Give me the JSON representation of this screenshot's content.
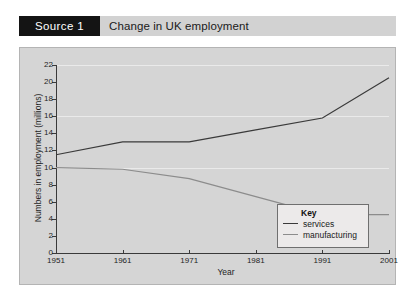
{
  "header": {
    "source_badge": "Source 1",
    "title": "Change in UK employment"
  },
  "legend": {
    "title": "Key",
    "entries": [
      {
        "label": "services",
        "color": "#3a3a3a"
      },
      {
        "label": "manufacturing",
        "color": "#8c8c8c"
      }
    ]
  },
  "colors": {
    "header_bar": "#d2d2d2",
    "source_badge_bg": "#141414",
    "plot_bg": "#d5d5d5",
    "axis": "#3a3a3a",
    "gridline": "#eaeaea",
    "services": "#3a3a3a",
    "manufacturing": "#8c8c8c"
  },
  "chart_data": {
    "type": "line",
    "title": "Change in UK employment",
    "xlabel": "Year",
    "ylabel": "Numbers in employment (millions)",
    "x": [
      1951,
      1961,
      1971,
      1981,
      1991,
      2001
    ],
    "xlim": [
      1951,
      2001
    ],
    "ylim": [
      0,
      22
    ],
    "xticks": [
      1951,
      1961,
      1971,
      1981,
      1991,
      2001
    ],
    "yticks": [
      0,
      2,
      4,
      6,
      8,
      10,
      12,
      14,
      16,
      18,
      20,
      22
    ],
    "xticklabels": [
      "1951",
      "1961",
      "1971",
      "1981",
      "1991",
      "2001"
    ],
    "yticklabels": [
      "0",
      "2",
      "4",
      "6",
      "8",
      "10",
      "12",
      "14",
      "16",
      "18",
      "20",
      "22"
    ],
    "grid": true,
    "gridlines_y": [
      10,
      16,
      22
    ],
    "legend_position": "center-right-inside",
    "series": [
      {
        "name": "services",
        "color": "#3a3a3a",
        "values": [
          11.5,
          13.0,
          13.0,
          14.4,
          15.8,
          20.5
        ]
      },
      {
        "name": "manufacturing",
        "color": "#8c8c8c",
        "values": [
          10.0,
          9.8,
          8.7,
          6.6,
          4.5,
          4.5
        ]
      }
    ]
  }
}
